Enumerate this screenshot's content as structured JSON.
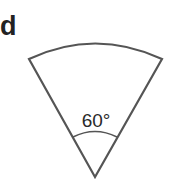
{
  "figure": {
    "label": "d",
    "shape": "sector",
    "angle_label": "60°",
    "angle_degrees": 60,
    "stroke_color": "#555555"
  }
}
